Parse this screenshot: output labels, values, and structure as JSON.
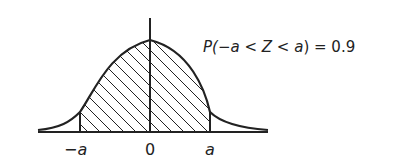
{
  "diagram": {
    "type": "normal-distribution-curve",
    "equation": {
      "prefix": "P(",
      "neg_sign": "−",
      "var_a1": "a",
      "lt1": " < ",
      "var_z": "Z",
      "lt2": " < ",
      "var_a2": "a",
      "suffix": ") = ",
      "value": "0.9"
    },
    "x_labels": {
      "neg_a": "−a",
      "zero": "0",
      "pos_a": "a"
    },
    "shaded_region": {
      "from": "−a",
      "to": "a",
      "pattern": "diagonal-hatch"
    },
    "colors": {
      "line": "#222222",
      "background": "#ffffff"
    }
  }
}
